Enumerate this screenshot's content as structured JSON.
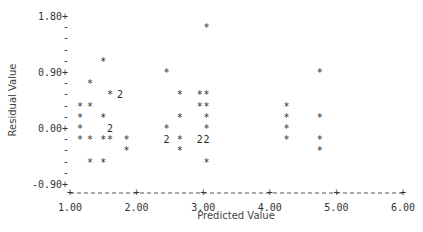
{
  "chart_data": {
    "type": "scatter",
    "title": "",
    "xlabel": "Predicted Value",
    "ylabel": "Residual Value",
    "xlim": [
      1.0,
      6.0
    ],
    "ylim": [
      -0.9,
      1.8
    ],
    "x_ticks": [
      "1.00",
      "2.00",
      "3.00",
      "4.00",
      "5.00",
      "6.00"
    ],
    "y_ticks": [
      "1.80",
      "0.90",
      "0.00",
      "-0.90"
    ],
    "grid": false,
    "legend": "none",
    "marker": "*",
    "note": "Digit '2' marks two coincident observations",
    "points": [
      {
        "x": 1.15,
        "y": 0.36,
        "m": "*"
      },
      {
        "x": 1.15,
        "y": 0.18,
        "m": "*"
      },
      {
        "x": 1.15,
        "y": 0.0,
        "m": "*"
      },
      {
        "x": 1.15,
        "y": -0.18,
        "m": "*"
      },
      {
        "x": 1.3,
        "y": 0.72,
        "m": "*"
      },
      {
        "x": 1.3,
        "y": 0.36,
        "m": "*"
      },
      {
        "x": 1.3,
        "y": -0.18,
        "m": "*"
      },
      {
        "x": 1.3,
        "y": -0.54,
        "m": "*"
      },
      {
        "x": 1.5,
        "y": 1.08,
        "m": "*"
      },
      {
        "x": 1.5,
        "y": 0.18,
        "m": "*"
      },
      {
        "x": 1.5,
        "y": -0.18,
        "m": "*"
      },
      {
        "x": 1.5,
        "y": -0.54,
        "m": "*"
      },
      {
        "x": 1.6,
        "y": 0.54,
        "m": "*"
      },
      {
        "x": 1.6,
        "y": 0.0,
        "m": "2"
      },
      {
        "x": 1.6,
        "y": -0.18,
        "m": "*"
      },
      {
        "x": 1.75,
        "y": 0.54,
        "m": "2"
      },
      {
        "x": 1.85,
        "y": -0.18,
        "m": "*"
      },
      {
        "x": 1.85,
        "y": -0.36,
        "m": "*"
      },
      {
        "x": 2.45,
        "y": 0.9,
        "m": "*"
      },
      {
        "x": 2.45,
        "y": 0.0,
        "m": "*"
      },
      {
        "x": 2.45,
        "y": -0.18,
        "m": "2"
      },
      {
        "x": 2.65,
        "y": 0.54,
        "m": "*"
      },
      {
        "x": 2.65,
        "y": 0.18,
        "m": "*"
      },
      {
        "x": 2.65,
        "y": -0.18,
        "m": "*"
      },
      {
        "x": 2.65,
        "y": -0.36,
        "m": "*"
      },
      {
        "x": 2.95,
        "y": 0.54,
        "m": "*"
      },
      {
        "x": 2.95,
        "y": 0.36,
        "m": "*"
      },
      {
        "x": 2.95,
        "y": -0.18,
        "m": "2"
      },
      {
        "x": 3.05,
        "y": 1.62,
        "m": "*"
      },
      {
        "x": 3.05,
        "y": 0.54,
        "m": "*"
      },
      {
        "x": 3.05,
        "y": 0.36,
        "m": "*"
      },
      {
        "x": 3.05,
        "y": 0.18,
        "m": "*"
      },
      {
        "x": 3.05,
        "y": 0.0,
        "m": "*"
      },
      {
        "x": 3.05,
        "y": -0.18,
        "m": "2"
      },
      {
        "x": 3.05,
        "y": -0.54,
        "m": "*"
      },
      {
        "x": 4.25,
        "y": 0.36,
        "m": "*"
      },
      {
        "x": 4.25,
        "y": 0.18,
        "m": "*"
      },
      {
        "x": 4.25,
        "y": 0.0,
        "m": "*"
      },
      {
        "x": 4.25,
        "y": -0.18,
        "m": "*"
      },
      {
        "x": 4.75,
        "y": 0.9,
        "m": "*"
      },
      {
        "x": 4.75,
        "y": 0.18,
        "m": "*"
      },
      {
        "x": 4.75,
        "y": -0.18,
        "m": "*"
      },
      {
        "x": 4.75,
        "y": -0.36,
        "m": "*"
      }
    ]
  }
}
